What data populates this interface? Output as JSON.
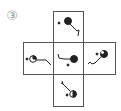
{
  "figure": {
    "label": "③",
    "type": "cube-net",
    "faces": [
      {
        "id": "top",
        "description": "small dot, filled black circle, line to lower right ending in a hook"
      },
      {
        "id": "left",
        "description": "small dot, half-filled circle, line to right ending in a hook"
      },
      {
        "id": "center",
        "description": "hook at upper left, line to filled black circle, small dot below"
      },
      {
        "id": "right",
        "description": "small dot, filled circle, line to lower left ending in a zigzag hook"
      },
      {
        "id": "bottom",
        "description": "hook at upper left, line to half-filled circle, small dot left"
      }
    ],
    "colors": {
      "line": "#222222",
      "border": "#555555",
      "label": "#9a9a9a"
    }
  }
}
